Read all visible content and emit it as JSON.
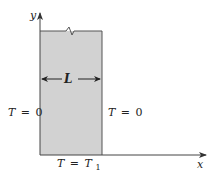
{
  "diagram": {
    "axes": {
      "x_label": "x",
      "y_label": "y"
    },
    "plate": {
      "fill_color": "#d4d4d4",
      "width_label": "L"
    },
    "boundary_conditions": {
      "left": {
        "var": "T",
        "eq": "=",
        "value": "0"
      },
      "right": {
        "var": "T",
        "eq": "=",
        "value": "0"
      },
      "bottom": {
        "var": "T",
        "eq": "=",
        "value": "T",
        "subscript": "1"
      }
    }
  }
}
